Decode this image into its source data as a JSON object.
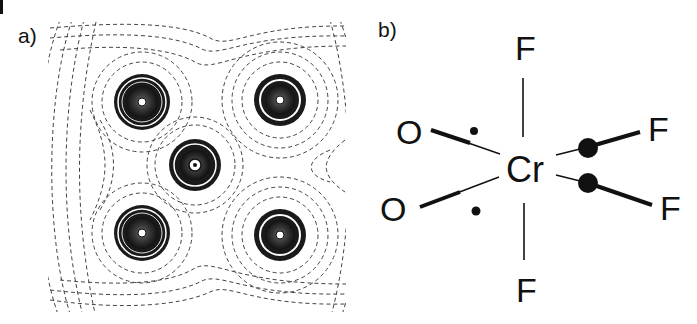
{
  "figure": {
    "panel_a": {
      "label": "a)",
      "description": "Electron density contour map with five atom centers",
      "atoms": [
        {
          "name": "top-left",
          "cx": 142,
          "cy": 102
        },
        {
          "name": "top-right",
          "cx": 280,
          "cy": 100
        },
        {
          "name": "center",
          "cx": 195,
          "cy": 165
        },
        {
          "name": "bottom-left",
          "cx": 142,
          "cy": 233
        },
        {
          "name": "bottom-right",
          "cx": 280,
          "cy": 235
        }
      ]
    },
    "panel_b": {
      "label": "b)",
      "central_atom": "Cr",
      "ligands": {
        "f_top": "F",
        "f_bottom": "F",
        "f_right_upper": "F",
        "f_right_lower": "F",
        "o_left_upper": "O",
        "o_left_lower": "O"
      }
    }
  }
}
